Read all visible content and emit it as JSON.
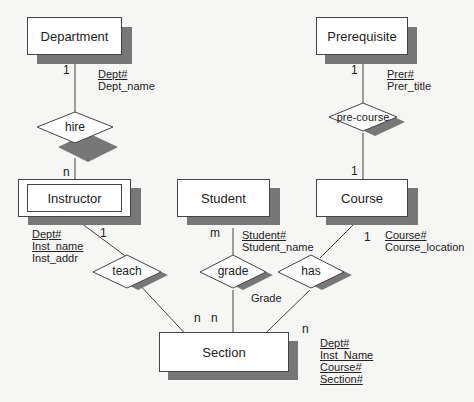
{
  "entities": {
    "department": {
      "name": "Department",
      "attrs": [
        {
          "text": "Dept#",
          "key": true
        },
        {
          "text": "Dept_name",
          "key": false
        }
      ]
    },
    "prerequisite": {
      "name": "Prerequisite",
      "attrs": [
        {
          "text": "Prer#",
          "key": true
        },
        {
          "text": "Prer_title",
          "key": false
        }
      ]
    },
    "instructor": {
      "name": "Instructor",
      "weak": true,
      "attrs": [
        {
          "text": "Dept#",
          "key": true
        },
        {
          "text": "Inst_name",
          "key": true
        },
        {
          "text": "Inst_addr",
          "key": false
        }
      ]
    },
    "student": {
      "name": "Student",
      "attrs": [
        {
          "text": "Student#",
          "key": true
        },
        {
          "text": "Student_name",
          "key": false
        }
      ]
    },
    "course": {
      "name": "Course",
      "attrs": [
        {
          "text": "Course#",
          "key": true
        },
        {
          "text": "Course_location",
          "key": false
        }
      ]
    },
    "section": {
      "name": "Section",
      "attrs": [
        {
          "text": "Dept#",
          "key": true
        },
        {
          "text": "Inst_Name",
          "key": true
        },
        {
          "text": "Course#",
          "key": true
        },
        {
          "text": "Section#",
          "key": true
        }
      ]
    }
  },
  "relationships": {
    "hire": {
      "name": "hire"
    },
    "pre_course": {
      "name": "pre-course"
    },
    "teach": {
      "name": "teach"
    },
    "grade": {
      "name": "grade",
      "attr": "Grade"
    },
    "has": {
      "name": "has"
    }
  },
  "cardinalities": {
    "dept_hire": "1",
    "hire_instructor": "n",
    "prer_precourse": "1",
    "precourse_course": "1",
    "instructor_teach": "1",
    "student_grade": "m",
    "course_has": "1",
    "teach_section": "n",
    "grade_section": "n",
    "has_section": "n"
  }
}
